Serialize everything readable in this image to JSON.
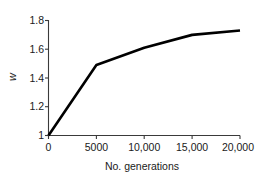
{
  "chart_data": {
    "type": "line",
    "title": "",
    "subtitle": "",
    "xlabel": "No. generations",
    "ylabel": "w",
    "xlim": [
      0,
      20000
    ],
    "ylim": [
      1.0,
      1.8
    ],
    "grid": false,
    "legend": null,
    "legend_position": "none",
    "x_tick_labels": [
      "0",
      "5000",
      "10,000",
      "15,000",
      "20,000"
    ],
    "x_tick_values": [
      0,
      5000,
      10000,
      15000,
      20000
    ],
    "y_tick_labels": [
      "1",
      "1.2",
      "1.4",
      "1.6",
      "1.8"
    ],
    "y_tick_values": [
      1.0,
      1.2,
      1.4,
      1.6,
      1.8
    ],
    "series": [
      {
        "name": "mean fitness",
        "color": "#000000",
        "x": [
          0,
          5000,
          10000,
          15000,
          20000
        ],
        "values": [
          1.0,
          1.49,
          1.61,
          1.7,
          1.73
        ]
      }
    ],
    "annotations": []
  },
  "axes": {
    "line_color": "#3a3a3a",
    "data_color": "#000000",
    "background": "#ffffff"
  }
}
